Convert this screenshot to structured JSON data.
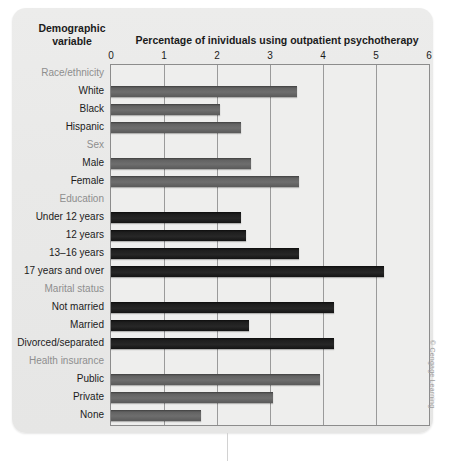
{
  "header": {
    "demographic_label_line1": "Demographic",
    "demographic_label_line2": "variable",
    "chart_title": "Percentage of inividuals using outpatient psychotherapy"
  },
  "credit": "© Cengage Learning",
  "colors": {
    "panel_background": "#e9e9e8",
    "plot_background": "#eeeeed",
    "bar_light": "#6e6e6e",
    "bar_dark": "#1e1e1e",
    "gridline": "#9a9a9a",
    "group_label": "#8e8e8e",
    "text": "#1b1b1b"
  },
  "chart_data": {
    "type": "bar",
    "orientation": "horizontal",
    "title": "Percentage of inividuals using outpatient psychotherapy",
    "xlabel": "Percentage of inividuals using outpatient psychotherapy",
    "ylabel": "Demographic variable",
    "xlim": [
      0,
      6
    ],
    "xticks": [
      0,
      1,
      2,
      3,
      4,
      5,
      6
    ],
    "xtick_labels": [
      "0",
      "1",
      "2",
      "3",
      "4",
      "5",
      "6"
    ],
    "grid": true,
    "grid_axis": "x",
    "legend": null,
    "rows": [
      {
        "label": "Race/ethnicity",
        "value": null,
        "is_group": true,
        "shade": "none"
      },
      {
        "label": "White",
        "value": 3.5,
        "is_group": false,
        "shade": "light"
      },
      {
        "label": "Black",
        "value": 2.05,
        "is_group": false,
        "shade": "light"
      },
      {
        "label": "Hispanic",
        "value": 2.45,
        "is_group": false,
        "shade": "light"
      },
      {
        "label": "Sex",
        "value": null,
        "is_group": true,
        "shade": "none"
      },
      {
        "label": "Male",
        "value": 2.65,
        "is_group": false,
        "shade": "light"
      },
      {
        "label": "Female",
        "value": 3.55,
        "is_group": false,
        "shade": "light"
      },
      {
        "label": "Education",
        "value": null,
        "is_group": true,
        "shade": "none"
      },
      {
        "label": "Under 12 years",
        "value": 2.45,
        "is_group": false,
        "shade": "dark"
      },
      {
        "label": "12 years",
        "value": 2.55,
        "is_group": false,
        "shade": "dark"
      },
      {
        "label": "13–16 years",
        "value": 3.55,
        "is_group": false,
        "shade": "dark"
      },
      {
        "label": "17 years and over",
        "value": 5.15,
        "is_group": false,
        "shade": "dark"
      },
      {
        "label": "Marital status",
        "value": null,
        "is_group": true,
        "shade": "none"
      },
      {
        "label": "Not married",
        "value": 4.2,
        "is_group": false,
        "shade": "dark"
      },
      {
        "label": "Married",
        "value": 2.6,
        "is_group": false,
        "shade": "dark"
      },
      {
        "label": "Divorced/separated",
        "value": 4.2,
        "is_group": false,
        "shade": "dark"
      },
      {
        "label": "Health insurance",
        "value": null,
        "is_group": true,
        "shade": "none"
      },
      {
        "label": "Public",
        "value": 3.95,
        "is_group": false,
        "shade": "light"
      },
      {
        "label": "Private",
        "value": 3.05,
        "is_group": false,
        "shade": "light"
      },
      {
        "label": "None",
        "value": 1.7,
        "is_group": false,
        "shade": "light"
      }
    ]
  }
}
